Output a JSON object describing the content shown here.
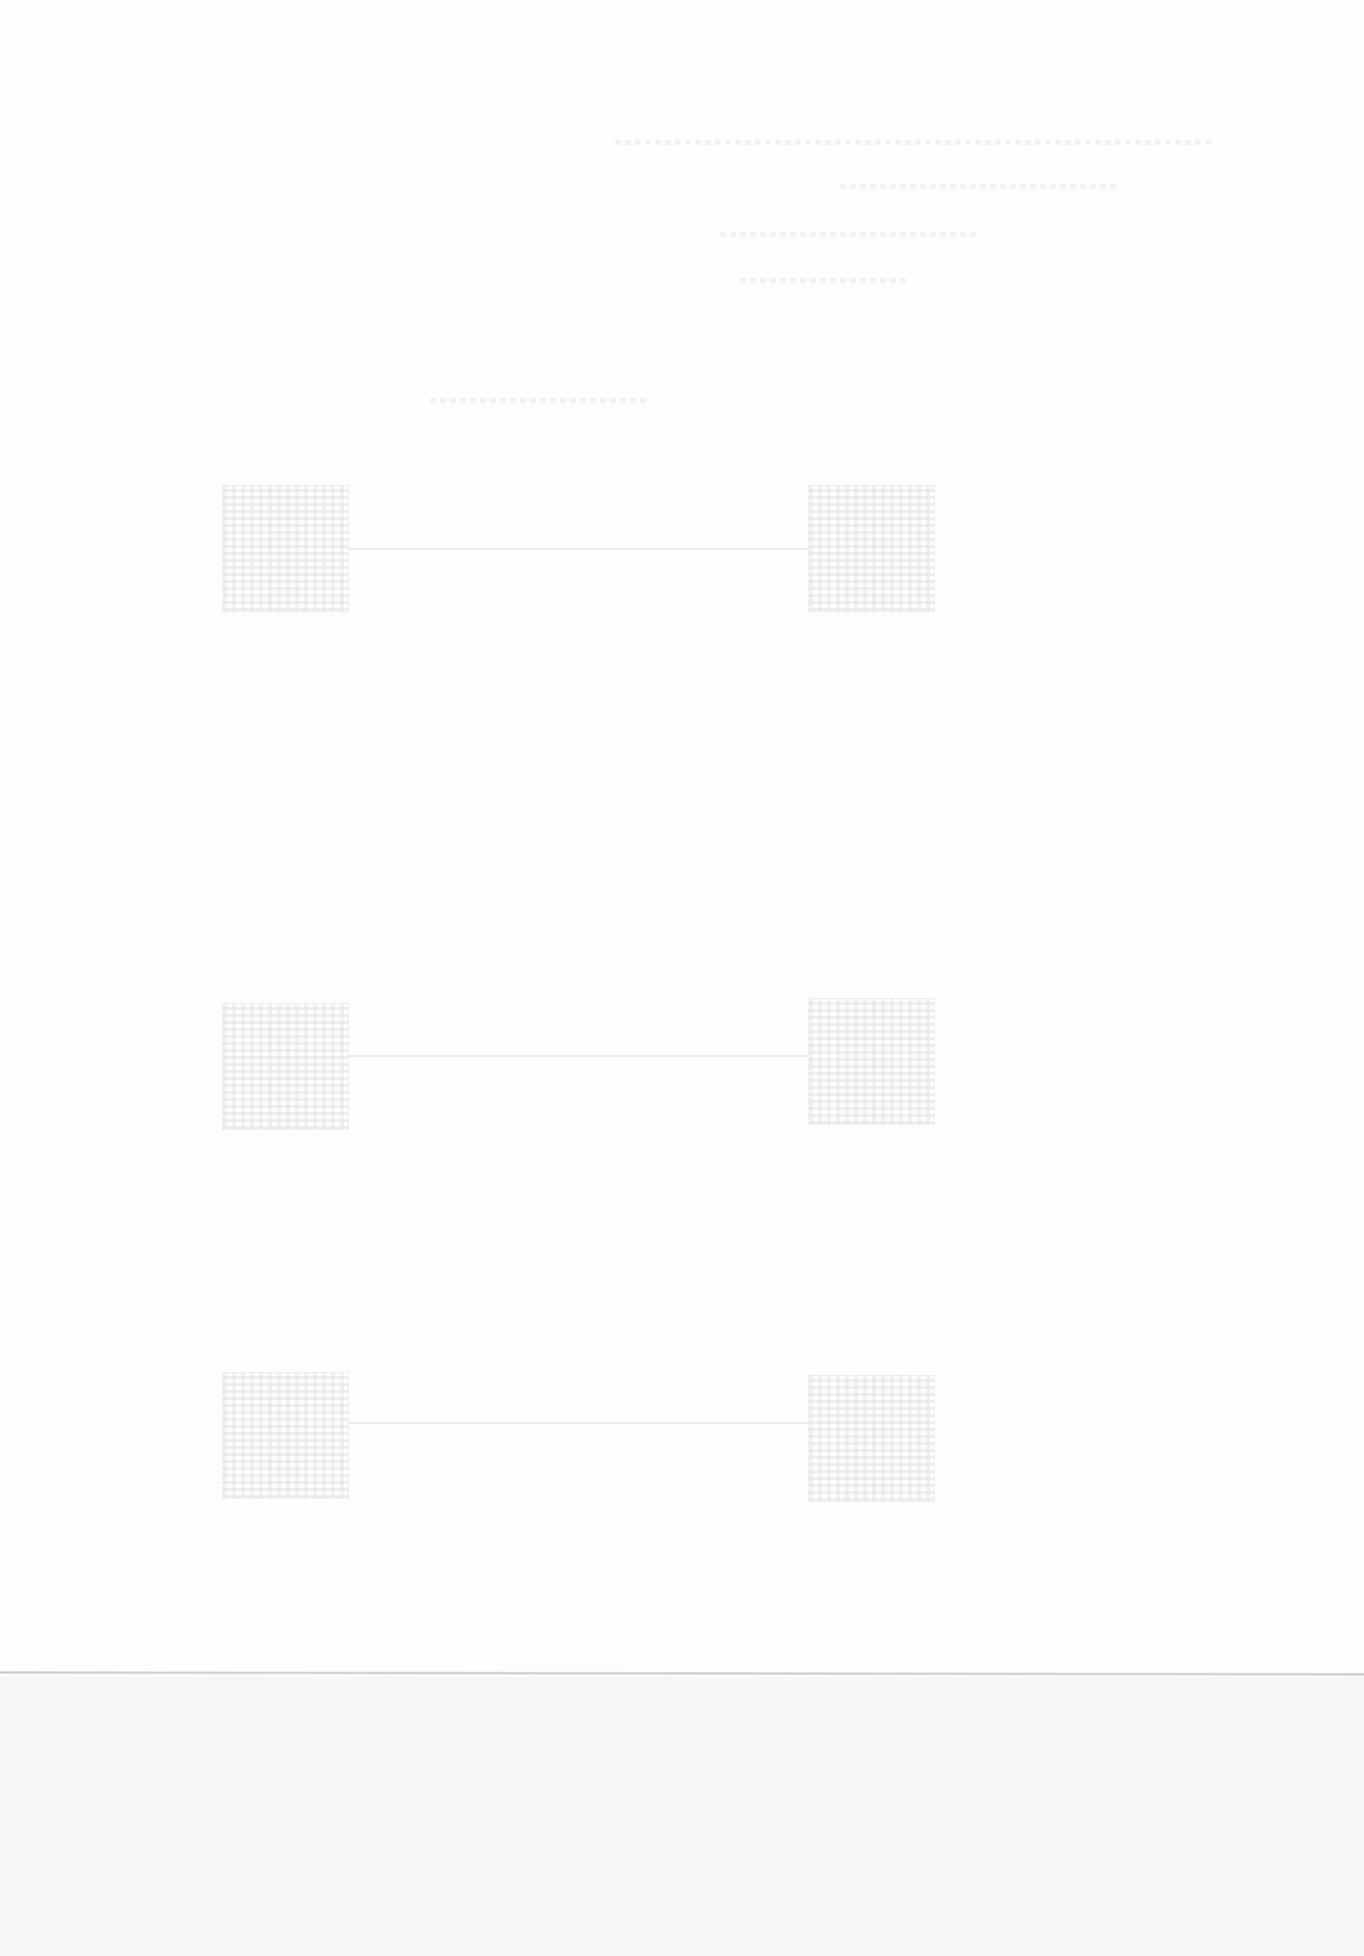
{
  "document": {
    "type": "scanned page",
    "legible_text": [],
    "header_lines": 4,
    "diagram_rows": [
      {
        "left_block": "square-block",
        "right_block": "square-block",
        "connector": true
      },
      {
        "left_block": "square-block",
        "right_block": "square-block",
        "connector": true
      },
      {
        "left_block": "square-block",
        "right_block": "square-block",
        "connector": true
      }
    ],
    "fold_line": true
  }
}
